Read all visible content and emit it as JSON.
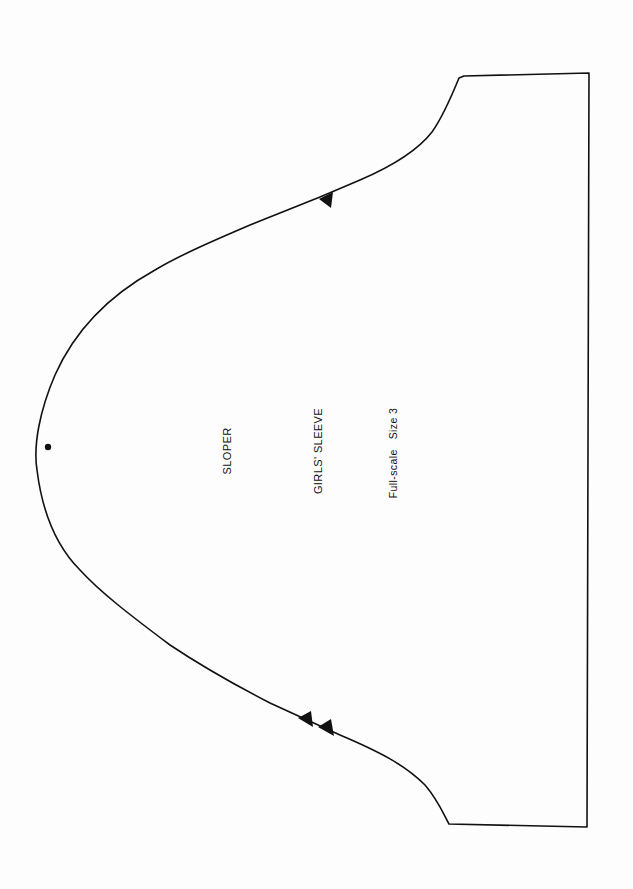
{
  "document": {
    "type": "sewing pattern piece",
    "labels": {
      "sloper": "SLOPER",
      "title": "GIRLS' SLEEVE",
      "scale": "Full-scale   Size 3"
    },
    "markings": {
      "front_notch_count": 1,
      "back_notch_count": 2,
      "shoulder_dot_count": 1
    },
    "colors": {
      "line": "#111111",
      "paper": "#fdfdfd"
    }
  }
}
